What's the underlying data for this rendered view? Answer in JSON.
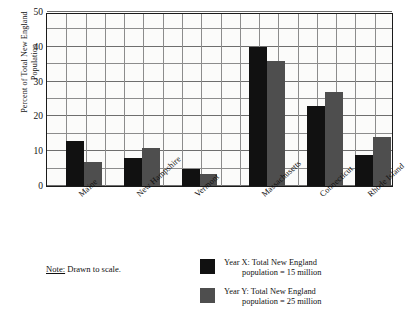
{
  "chart_data": {
    "type": "bar",
    "title": "",
    "xlabel": "",
    "ylabel": "Percent of Total New England\nPopulation",
    "ylim": [
      0,
      50
    ],
    "ytick_step": 10,
    "yminor_step": 5,
    "grid": true,
    "legend_position": "bottom-right",
    "categories": [
      "Maine",
      "New Hampshire",
      "Vermont",
      "Massachusetts",
      "Connecticut",
      "Rhode Island"
    ],
    "series": [
      {
        "name": "Year X",
        "color": "#111111",
        "values": [
          13,
          8,
          5,
          40,
          23,
          9
        ]
      },
      {
        "name": "Year Y",
        "color": "#4e4e4e",
        "values": [
          7,
          11,
          3.5,
          36,
          27,
          14
        ]
      }
    ],
    "ytick_labels": [
      "0",
      "10",
      "20",
      "30",
      "40",
      "50"
    ],
    "annotations": {
      "note": "Drawn to scale.",
      "note_label": "Note:"
    }
  },
  "yaxis": {
    "title_line1": "Percent of Total New England",
    "title_line2": "Population"
  },
  "note": {
    "label": "Note:",
    "text": " Drawn to scale."
  },
  "legend": {
    "items": [
      {
        "label_line1": "Year X: Total New England",
        "label_line2": "population = 15 million",
        "color": "#111111",
        "swatch_name": "legend-swatch-year-x"
      },
      {
        "label_line1": "Year Y: Total New England",
        "label_line2": "population = 25 million",
        "color": "#4e4e4e",
        "swatch_name": "legend-swatch-year-y"
      }
    ]
  }
}
